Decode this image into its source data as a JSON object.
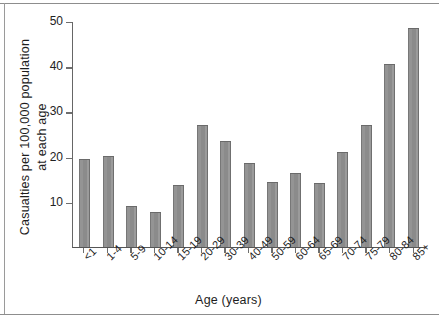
{
  "chart_data": {
    "type": "bar",
    "title": "",
    "xlabel": "Age (years)",
    "ylabel": "Casualties per 100,000 population at each age",
    "ylabel_line1": "Casualties per 100,000 population",
    "ylabel_line2": "at each age",
    "categories": [
      "<1",
      "1-4",
      "5-9",
      "10-14",
      "15-19",
      "20-29",
      "30-39",
      "40-49",
      "50-59",
      "60-64",
      "65-69",
      "70-74",
      "75-79",
      "80-84",
      "85+"
    ],
    "values": [
      19.4,
      20.2,
      9.1,
      7.8,
      13.7,
      27.0,
      23.4,
      18.6,
      14.4,
      16.4,
      14.2,
      21.0,
      26.9,
      40.4,
      48.5
    ],
    "ylim": [
      0,
      50
    ],
    "yticks": [
      10,
      20,
      30,
      40,
      50
    ],
    "ytick_labels": [
      "10",
      "20",
      "30",
      "40",
      "50"
    ],
    "grid": false,
    "legend": null,
    "bar_color": "#8f8f8f",
    "bar_edge_color": "#6a6a6a",
    "axis_color": "#5d5d5d",
    "background": "#ffffff"
  }
}
